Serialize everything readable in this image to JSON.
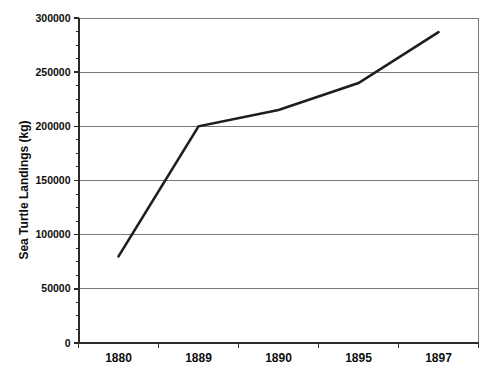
{
  "decorations": {
    "cropped_text_remnant": "__ _______ ___ __ ______ ____ ___"
  },
  "chart_data": {
    "type": "line",
    "title": "",
    "xlabel": "",
    "ylabel": "Sea Turtle Landings (kg)",
    "categories": [
      "1880",
      "1889",
      "1890",
      "1895",
      "1897"
    ],
    "series": [
      {
        "name": "Sea Turtle Landings (kg)",
        "values": [
          80000,
          200000,
          215000,
          240000,
          287000
        ]
      }
    ],
    "ylim": [
      0,
      300000
    ],
    "y_major_unit": 50000,
    "y_minor_divisions": 4,
    "y_tick_labels": [
      "0",
      "50000",
      "100000",
      "150000",
      "200000",
      "250000",
      "300000"
    ],
    "grid": "horizontal-major",
    "legend": "none",
    "colors": {
      "line": "#1e1e1e",
      "grid": "#787878",
      "plot_border": "#787878",
      "axis": "#2a2a2a",
      "tick": "#2a2a2a",
      "label": "#0d0d0d",
      "background": "#ffffff"
    }
  }
}
